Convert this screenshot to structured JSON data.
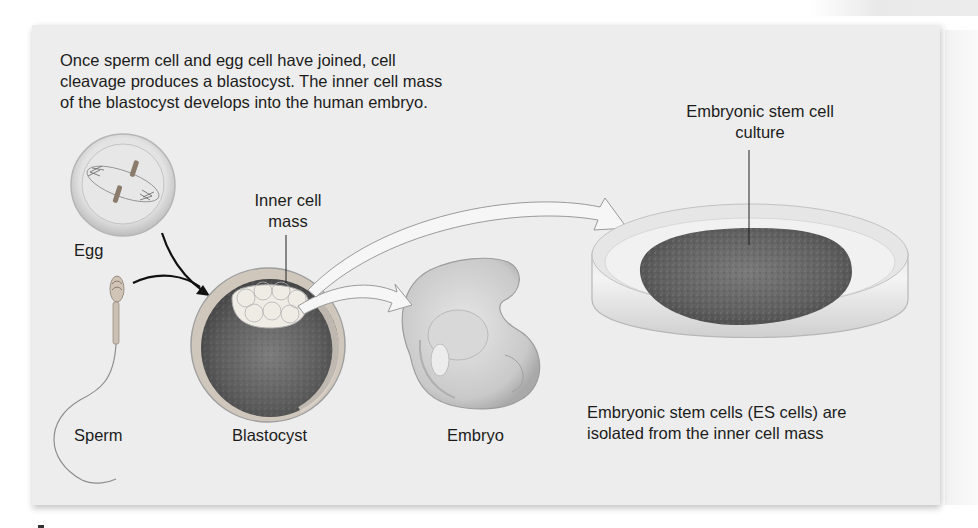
{
  "figure": {
    "intro_text": [
      "Once sperm cell and egg cell have joined, cell",
      "cleavage produces a blastocyst. The inner cell mass",
      "of the blastocyst develops into the human embryo."
    ],
    "labels": {
      "egg": "Egg",
      "sperm": "Sperm",
      "blastocyst": "Blastocyst",
      "embryo": "Embryo",
      "inner_cell_mass": [
        "Inner cell",
        "mass"
      ],
      "es_culture": [
        "Embryonic stem cell",
        "culture"
      ]
    },
    "es_caption": [
      "Embryonic stem cells (ES cells) are",
      "isolated from the inner cell mass"
    ],
    "colors": {
      "panel_background": "#ededed",
      "text": "#1c1c1c",
      "arrow_black": "#111111",
      "culture_dark": "#5a5a5a"
    }
  }
}
